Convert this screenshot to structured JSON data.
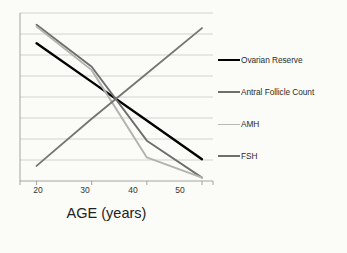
{
  "chart_data": {
    "type": "line",
    "title": "",
    "xlabel": "AGE (years)",
    "ylabel": "",
    "x": [
      20,
      30,
      40,
      50
    ],
    "xlim": [
      17,
      52
    ],
    "ylim": [
      0,
      100
    ],
    "xticks": [
      "20",
      "30",
      "40",
      "50"
    ],
    "grid": true,
    "gridlines": 8,
    "legend_position": "right",
    "series": [
      {
        "name": "Ovarian Reserve",
        "color": "#000000",
        "width": 2.4,
        "values": [
          82,
          59,
          36,
          13
        ]
      },
      {
        "name": "Antral Follicle Count",
        "color": "#6e6e6e",
        "width": 1.9,
        "values": [
          93,
          68,
          24,
          2
        ]
      },
      {
        "name": "AMH",
        "color": "#b3b3ae",
        "width": 1.9,
        "values": [
          92,
          66,
          14,
          2
        ]
      },
      {
        "name": "FSH",
        "color": "#777772",
        "width": 1.9,
        "values": [
          9,
          37,
          64,
          91
        ]
      }
    ]
  },
  "axis": {
    "title": "AGE (years)",
    "ticks": [
      "20",
      "30",
      "40",
      "50"
    ]
  },
  "legend": {
    "items": [
      {
        "label": "Ovarian Reserve",
        "color": "#000000",
        "width": 2.6
      },
      {
        "label": "Antral Follicle Count",
        "color": "#6e6e6e",
        "width": 2.0
      },
      {
        "label": "AMH",
        "color": "#b9b9b4",
        "width": 1.6
      },
      {
        "label": "FSH",
        "color": "#6f6f6a",
        "width": 2.0
      }
    ]
  },
  "style": {
    "background": "#fbfbf7",
    "grid_color": "#c9c9c4",
    "axis_color": "#9a9a95",
    "text_color": "#2b2b2b"
  }
}
